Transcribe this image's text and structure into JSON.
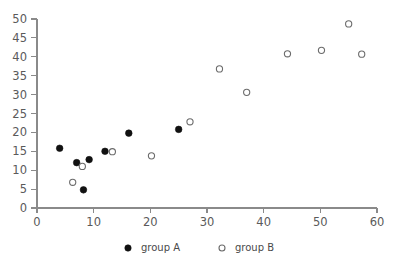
{
  "chart_data": {
    "type": "scatter",
    "title": "",
    "xlabel": "",
    "ylabel": "",
    "xlim": [
      0,
      60
    ],
    "ylim": [
      0,
      50
    ],
    "xticks": [
      0,
      10,
      20,
      30,
      40,
      50,
      60
    ],
    "yticks": [
      0,
      5,
      10,
      15,
      20,
      25,
      30,
      35,
      40,
      45,
      50
    ],
    "xtick_labels": [
      "0",
      "10",
      "20",
      "30",
      "40",
      "50",
      "60"
    ],
    "ytick_labels": [
      "0",
      "5",
      "10",
      "15",
      "20",
      "25",
      "30",
      "35",
      "40",
      "45",
      "50"
    ],
    "grid": false,
    "legend_position": "bottom",
    "series": [
      {
        "name": "group A",
        "marker": "filled-circle",
        "color": "#111111",
        "points": [
          {
            "x": 4.0,
            "y": 15.8
          },
          {
            "x": 7.0,
            "y": 12.0
          },
          {
            "x": 8.2,
            "y": 4.8
          },
          {
            "x": 9.2,
            "y": 12.8
          },
          {
            "x": 12.0,
            "y": 15.0
          },
          {
            "x": 16.2,
            "y": 19.8
          },
          {
            "x": 25.0,
            "y": 20.8
          }
        ]
      },
      {
        "name": "group B",
        "marker": "open-circle",
        "color": "#6b6b6b",
        "points": [
          {
            "x": 6.3,
            "y": 6.8
          },
          {
            "x": 8.0,
            "y": 11.0
          },
          {
            "x": 13.3,
            "y": 14.9
          },
          {
            "x": 20.2,
            "y": 13.8
          },
          {
            "x": 27.0,
            "y": 22.8
          },
          {
            "x": 32.2,
            "y": 36.8
          },
          {
            "x": 37.0,
            "y": 30.6
          },
          {
            "x": 44.2,
            "y": 40.8
          },
          {
            "x": 50.2,
            "y": 41.7
          },
          {
            "x": 55.0,
            "y": 48.7
          },
          {
            "x": 57.3,
            "y": 40.7
          }
        ]
      }
    ]
  },
  "legend": {
    "items": [
      {
        "label": "group A",
        "marker": "filled-circle"
      },
      {
        "label": "group B",
        "marker": "open-circle"
      }
    ]
  },
  "colors": {
    "background": "#ffffff",
    "axis": "#8a8a8a",
    "tick_text": "#5a5a5a",
    "group_a": "#111111",
    "group_b": "#6b6b6b"
  }
}
